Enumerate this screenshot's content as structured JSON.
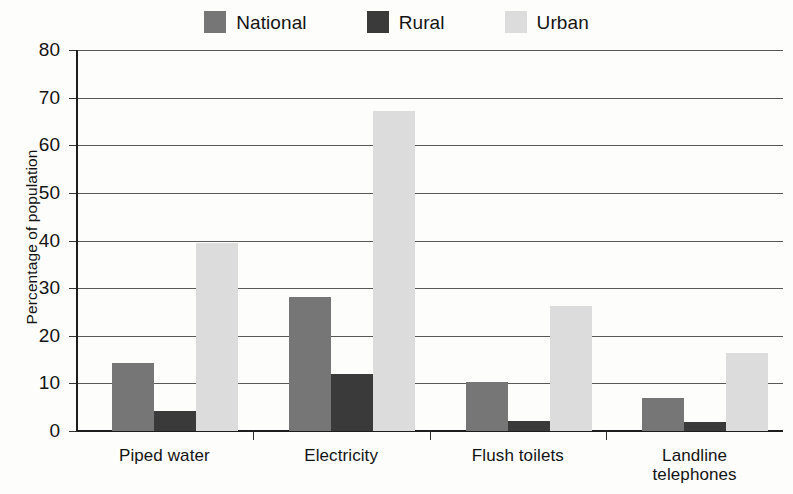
{
  "chart_data": {
    "type": "bar",
    "title": "",
    "xlabel": "",
    "ylabel": "Percentage of population",
    "ylim": [
      0,
      80
    ],
    "ytick_values": [
      80,
      70,
      60,
      50,
      40,
      30,
      20,
      10,
      0
    ],
    "ytick_labels": [
      "80",
      "70",
      "60",
      "50",
      "40",
      "30",
      "20",
      "10",
      "0"
    ],
    "grid": true,
    "grid_axis": "y",
    "legend_position": "top-center",
    "categories": [
      "Piped water",
      "Electricity",
      "Flush toilets",
      "Landline telephones"
    ],
    "category_lines": [
      [
        "Piped water"
      ],
      [
        "Electricity"
      ],
      [
        "Flush toilets"
      ],
      [
        "Landline",
        "telephones"
      ]
    ],
    "series": [
      {
        "name": "National",
        "color": "#767676",
        "values": [
          14.2,
          28.2,
          10.3,
          7.0
        ]
      },
      {
        "name": "Rural",
        "color": "#3a3a3a",
        "values": [
          4.2,
          11.9,
          2.0,
          1.8
        ]
      },
      {
        "name": "Urban",
        "color": "#dcdcdc",
        "values": [
          39.4,
          67.1,
          26.2,
          16.3
        ]
      }
    ]
  },
  "legend": {
    "items": [
      {
        "label": "National",
        "color": "#767676"
      },
      {
        "label": "Rural",
        "color": "#3a3a3a"
      },
      {
        "label": "Urban",
        "color": "#dcdcdc"
      }
    ]
  }
}
